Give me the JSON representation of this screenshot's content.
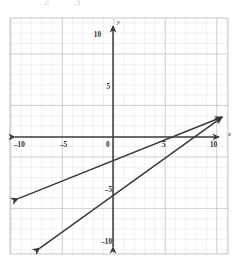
{
  "page": {
    "background_color": "#ffffff",
    "width": 242,
    "height": 261,
    "remnant_top_1": "2",
    "remnant_top_2": "3"
  },
  "chart_data": {
    "type": "line",
    "title": "",
    "subtitle": "",
    "xlabel": "x",
    "ylabel": "y",
    "xlim": [
      -10.0,
      11.2
    ],
    "ylim": [
      -11.6,
      11.6
    ],
    "grid": true,
    "grid_step": 1,
    "major_grid_step": 5,
    "legend": "none",
    "axis_arrows": "both-ends",
    "x_ticks": [
      -10,
      -5,
      0,
      5,
      10
    ],
    "x_tick_labels": [
      "–10",
      "–5",
      "0",
      "5",
      "10"
    ],
    "y_ticks": [
      10,
      5,
      -5,
      -10
    ],
    "y_tick_labels": [
      "10",
      "5",
      "–5",
      "–10"
    ],
    "origin_label": "0",
    "series": [
      {
        "name": "line-1",
        "type": "line",
        "color": "#3a3a3a",
        "slope": 0.4,
        "intercept": -2.3,
        "arrowheads": "both",
        "x": [
          -9.2,
          10.6
        ],
        "y": [
          -5.98,
          1.94
        ],
        "endpoints_px": [
          [
            18,
            197
          ],
          [
            222,
            118
          ]
        ]
      },
      {
        "name": "line-2",
        "type": "line",
        "color": "#3a3a3a",
        "slope": 1.25,
        "intercept": -11.3,
        "arrowheads": "both",
        "x": [
          -7.1,
          10.6
        ],
        "y": [
          -10.78,
          1.94
        ],
        "endpoints_px": [
          [
            40,
            248
          ],
          [
            222,
            118
          ]
        ]
      }
    ],
    "colors": {
      "grid_minor": "#d9d9de",
      "grid_major": "#a8a8b0",
      "axis": "#3d3d3d",
      "line": "#3a3a3a",
      "label": "#2b2b2b"
    }
  }
}
